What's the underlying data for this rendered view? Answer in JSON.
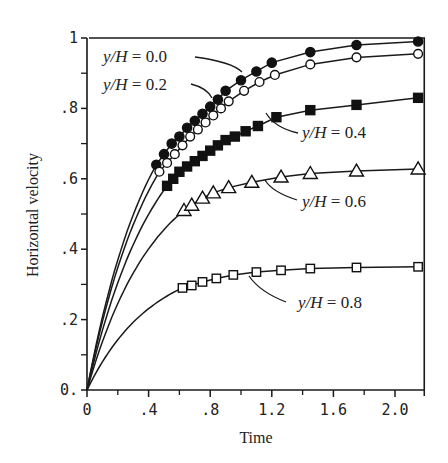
{
  "chart_data": {
    "type": "line",
    "title": "",
    "xlabel": "Time",
    "ylabel": "Horizontal velocity",
    "xlim": [
      0,
      2.19
    ],
    "ylim": [
      0,
      1.0
    ],
    "grid": false,
    "legend": "inline annotations with leader lines",
    "x_ticks": {
      "major": [
        0,
        0.4,
        0.8,
        1.2,
        1.6,
        2.0
      ],
      "minor": [
        0.2,
        0.6,
        1.0,
        1.4,
        1.8
      ],
      "labels": [
        "0",
        ".4",
        ".8",
        "1.2",
        "1.6",
        "2.0"
      ]
    },
    "y_ticks": {
      "major": [
        0,
        0.2,
        0.4,
        0.6,
        0.8,
        1.0
      ],
      "minor": [
        0.1,
        0.3,
        0.5,
        0.7,
        0.9
      ],
      "labels": [
        "0.",
        ".2",
        ".4",
        ".6",
        ".8",
        "1"
      ]
    },
    "series": [
      {
        "name": "y/H = 0.0",
        "marker": "filled-circle",
        "asymptote": 1.0,
        "rate": 2.4,
        "x": [
          0.45,
          0.5,
          0.55,
          0.6,
          0.65,
          0.7,
          0.75,
          0.8,
          0.85,
          0.9,
          1.0,
          1.1,
          1.2,
          1.45,
          1.75,
          2.15
        ],
        "y": [
          0.64,
          0.67,
          0.7,
          0.72,
          0.745,
          0.765,
          0.785,
          0.805,
          0.825,
          0.85,
          0.88,
          0.905,
          0.93,
          0.96,
          0.98,
          0.99
        ]
      },
      {
        "name": "y/H = 0.2",
        "marker": "open-circle",
        "asymptote": 0.955,
        "rate": 2.35,
        "x": [
          0.47,
          0.52,
          0.57,
          0.62,
          0.67,
          0.72,
          0.77,
          0.82,
          0.87,
          0.92,
          1.02,
          1.12,
          1.22,
          1.45,
          1.75,
          2.15
        ],
        "y": [
          0.62,
          0.645,
          0.67,
          0.695,
          0.72,
          0.74,
          0.76,
          0.78,
          0.8,
          0.82,
          0.85,
          0.875,
          0.895,
          0.925,
          0.945,
          0.955
        ]
      },
      {
        "name": "y/H = 0.4",
        "marker": "filled-square",
        "asymptote": 0.83,
        "rate": 2.25,
        "x": [
          0.52,
          0.56,
          0.6,
          0.65,
          0.7,
          0.75,
          0.8,
          0.85,
          0.9,
          0.96,
          1.03,
          1.11,
          1.23,
          1.45,
          1.75,
          2.15
        ],
        "y": [
          0.58,
          0.6,
          0.62,
          0.635,
          0.65,
          0.665,
          0.68,
          0.695,
          0.71,
          0.72,
          0.735,
          0.75,
          0.775,
          0.795,
          0.81,
          0.83
        ]
      },
      {
        "name": "y/H = 0.6",
        "marker": "open-triangle",
        "asymptote": 0.63,
        "rate": 2.3,
        "x": [
          0.63,
          0.68,
          0.75,
          0.82,
          0.92,
          1.07,
          1.26,
          1.45,
          1.75,
          2.15
        ],
        "y": [
          0.51,
          0.525,
          0.545,
          0.56,
          0.575,
          0.59,
          0.605,
          0.615,
          0.622,
          0.628
        ]
      },
      {
        "name": "y/H = 0.8",
        "marker": "open-square",
        "asymptote": 0.35,
        "rate": 2.4,
        "x": [
          0.62,
          0.68,
          0.75,
          0.84,
          0.95,
          1.1,
          1.26,
          1.45,
          1.75,
          2.15
        ],
        "y": [
          0.29,
          0.297,
          0.307,
          0.317,
          0.327,
          0.335,
          0.34,
          0.345,
          0.348,
          0.35
        ]
      }
    ],
    "annotations": [
      {
        "text_pre": "y/H",
        "text_post": " = 0.0",
        "label_x_px": 103,
        "label_y_px": 62,
        "leader": [
          [
            195,
            57
          ],
          [
            232,
            62
          ],
          [
            242,
            72
          ]
        ]
      },
      {
        "text_pre": "y/H",
        "text_post": " = 0.2",
        "label_x_px": 103,
        "label_y_px": 90,
        "leader": [
          [
            191,
            84
          ],
          [
            207,
            88
          ],
          [
            212,
            98
          ]
        ]
      },
      {
        "text_pre": "y/H",
        "text_post": " = 0.4",
        "label_x_px": 302,
        "label_y_px": 138,
        "leader": [
          [
            298,
            133
          ],
          [
            275,
            128
          ],
          [
            266,
            113
          ]
        ]
      },
      {
        "text_pre": "y/H",
        "text_post": " = 0.6",
        "label_x_px": 302,
        "label_y_px": 207,
        "leader": [
          [
            297,
            200
          ],
          [
            272,
            192
          ],
          [
            265,
            180
          ]
        ]
      },
      {
        "text_pre": "y/H",
        "text_post": " = 0.8",
        "label_x_px": 298,
        "label_y_px": 308,
        "leader": [
          [
            286,
            302
          ],
          [
            260,
            292
          ],
          [
            249,
            276
          ]
        ]
      }
    ]
  }
}
